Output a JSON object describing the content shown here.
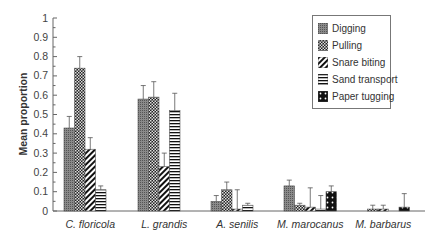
{
  "chart_data": {
    "type": "bar",
    "title": "",
    "xlabel": "",
    "ylabel": "Mean proportion",
    "ylim": [
      0,
      1
    ],
    "yticks": [
      "0",
      "0.1",
      "0.2",
      "0.3",
      "0.4",
      "0.5",
      "0.6",
      "0.7",
      "0.8",
      "0.9",
      "1"
    ],
    "grid": false,
    "legend_position": "upper right",
    "categories": [
      "C. floricola",
      "L. grandis",
      "A. senilis",
      "M. marocanus",
      "M. barbarus"
    ],
    "series": [
      {
        "name": "Digging",
        "pattern": "fine-dots-grey",
        "values": [
          0.43,
          0.58,
          0.05,
          0.13,
          0.0
        ],
        "errors": [
          0.06,
          0.07,
          0.03,
          0.03,
          0.0
        ]
      },
      {
        "name": "Pulling",
        "pattern": "checker",
        "values": [
          0.74,
          0.59,
          0.11,
          0.03,
          0.01
        ],
        "errors": [
          0.06,
          0.08,
          0.04,
          0.01,
          0.02
        ]
      },
      {
        "name": "Snare biting",
        "pattern": "diagonal-stripes",
        "values": [
          0.32,
          0.23,
          0.01,
          0.02,
          0.01
        ],
        "errors": [
          0.06,
          0.07,
          0.1,
          0.1,
          0.02
        ]
      },
      {
        "name": "Sand transport",
        "pattern": "horizontal-stripes",
        "values": [
          0.11,
          0.52,
          0.03,
          0.01,
          0.0
        ],
        "errors": [
          0.02,
          0.09,
          0.01,
          0.07,
          0.0
        ]
      },
      {
        "name": "Paper tugging",
        "pattern": "black-dots",
        "values": [
          0.0,
          0.0,
          0.0,
          0.1,
          0.02
        ],
        "errors": [
          0.0,
          0.0,
          0.0,
          0.03,
          0.07
        ]
      }
    ]
  }
}
